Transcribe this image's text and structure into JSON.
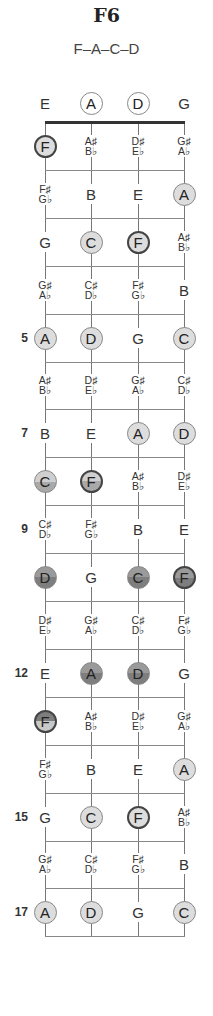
{
  "title": "F6",
  "subtitle": "F–A–C–D",
  "colors": {
    "line": "#777777",
    "nut": "#333333",
    "light_fill": "#dddddd",
    "mid_fill": "#a9a9a9",
    "dark_fill": "#7e7e7e",
    "root_border": "#444444"
  },
  "strings": [
    "E",
    "A",
    "D",
    "G"
  ],
  "fret_labels": [
    {
      "fret": 5,
      "label": "5"
    },
    {
      "fret": 7,
      "label": "7"
    },
    {
      "fret": 9,
      "label": "9"
    },
    {
      "fret": 12,
      "label": "12"
    },
    {
      "fret": 15,
      "label": "15"
    },
    {
      "fret": 17,
      "label": "17"
    }
  ],
  "rows": [
    {
      "fret": 0,
      "notes": [
        {
          "text": "E",
          "style": "plain"
        },
        {
          "text": "A",
          "style": "open"
        },
        {
          "text": "D",
          "style": "open"
        },
        {
          "text": "G",
          "style": "plain"
        }
      ]
    },
    {
      "fret": 1,
      "notes": [
        {
          "text": "F",
          "style": "root"
        },
        {
          "sharp": "A♯",
          "flat": "B♭",
          "style": "pair"
        },
        {
          "sharp": "D♯",
          "flat": "E♭",
          "style": "pair"
        },
        {
          "sharp": "G♯",
          "flat": "A♭",
          "style": "pair"
        }
      ]
    },
    {
      "fret": 2,
      "notes": [
        {
          "sharp": "F♯",
          "flat": "G♭",
          "style": "pair"
        },
        {
          "text": "B",
          "style": "plain"
        },
        {
          "text": "E",
          "style": "plain"
        },
        {
          "text": "A",
          "style": "light"
        }
      ]
    },
    {
      "fret": 3,
      "notes": [
        {
          "text": "G",
          "style": "plain"
        },
        {
          "text": "C",
          "style": "light"
        },
        {
          "text": "F",
          "style": "root"
        },
        {
          "sharp": "A♯",
          "flat": "B♭",
          "style": "pair"
        }
      ]
    },
    {
      "fret": 4,
      "notes": [
        {
          "sharp": "G♯",
          "flat": "A♭",
          "style": "pair"
        },
        {
          "sharp": "C♯",
          "flat": "D♭",
          "style": "pair"
        },
        {
          "sharp": "F♯",
          "flat": "G♭",
          "style": "pair"
        },
        {
          "text": "B",
          "style": "plain"
        }
      ]
    },
    {
      "fret": 5,
      "notes": [
        {
          "text": "A",
          "style": "light"
        },
        {
          "text": "D",
          "style": "light"
        },
        {
          "text": "G",
          "style": "plain"
        },
        {
          "text": "C",
          "style": "light"
        }
      ]
    },
    {
      "fret": 6,
      "notes": [
        {
          "sharp": "A♯",
          "flat": "B♭",
          "style": "pair"
        },
        {
          "sharp": "D♯",
          "flat": "E♭",
          "style": "pair"
        },
        {
          "sharp": "G♯",
          "flat": "A♭",
          "style": "pair"
        },
        {
          "sharp": "C♯",
          "flat": "D♭",
          "style": "pair"
        }
      ]
    },
    {
      "fret": 7,
      "notes": [
        {
          "text": "B",
          "style": "plain"
        },
        {
          "text": "E",
          "style": "plain"
        },
        {
          "text": "A",
          "style": "light"
        },
        {
          "text": "D",
          "style": "light"
        }
      ]
    },
    {
      "fret": 8,
      "notes": [
        {
          "text": "C",
          "style": "half"
        },
        {
          "text": "F",
          "style": "half-root"
        },
        {
          "sharp": "A♯",
          "flat": "B♭",
          "style": "pair"
        },
        {
          "sharp": "D♯",
          "flat": "E♭",
          "style": "pair"
        }
      ]
    },
    {
      "fret": 9,
      "notes": [
        {
          "sharp": "C♯",
          "flat": "D♭",
          "style": "pair"
        },
        {
          "sharp": "F♯",
          "flat": "G♭",
          "style": "pair"
        },
        {
          "text": "B",
          "style": "plain"
        },
        {
          "text": "E",
          "style": "plain"
        }
      ]
    },
    {
      "fret": 10,
      "notes": [
        {
          "text": "D",
          "style": "dark"
        },
        {
          "text": "G",
          "style": "plain"
        },
        {
          "text": "C",
          "style": "dark"
        },
        {
          "text": "F",
          "style": "dark-root"
        }
      ]
    },
    {
      "fret": 11,
      "notes": [
        {
          "sharp": "D♯",
          "flat": "E♭",
          "style": "pair"
        },
        {
          "sharp": "G♯",
          "flat": "A♭",
          "style": "pair"
        },
        {
          "sharp": "C♯",
          "flat": "D♭",
          "style": "pair"
        },
        {
          "sharp": "F♯",
          "flat": "G♭",
          "style": "pair"
        }
      ]
    },
    {
      "fret": 12,
      "notes": [
        {
          "text": "E",
          "style": "plain"
        },
        {
          "text": "A",
          "style": "dark"
        },
        {
          "text": "D",
          "style": "dark"
        },
        {
          "text": "G",
          "style": "plain"
        }
      ]
    },
    {
      "fret": 13,
      "notes": [
        {
          "text": "F",
          "style": "halfdark-root"
        },
        {
          "sharp": "A♯",
          "flat": "B♭",
          "style": "pair"
        },
        {
          "sharp": "D♯",
          "flat": "E♭",
          "style": "pair"
        },
        {
          "sharp": "G♯",
          "flat": "A♭",
          "style": "pair"
        }
      ]
    },
    {
      "fret": 14,
      "notes": [
        {
          "sharp": "F♯",
          "flat": "G♭",
          "style": "pair"
        },
        {
          "text": "B",
          "style": "plain"
        },
        {
          "text": "E",
          "style": "plain"
        },
        {
          "text": "A",
          "style": "light"
        }
      ]
    },
    {
      "fret": 15,
      "notes": [
        {
          "text": "G",
          "style": "plain"
        },
        {
          "text": "C",
          "style": "light"
        },
        {
          "text": "F",
          "style": "root"
        },
        {
          "sharp": "A♯",
          "flat": "B♭",
          "style": "pair"
        }
      ]
    },
    {
      "fret": 16,
      "notes": [
        {
          "sharp": "G♯",
          "flat": "A♭",
          "style": "pair"
        },
        {
          "sharp": "C♯",
          "flat": "D♭",
          "style": "pair"
        },
        {
          "sharp": "F♯",
          "flat": "G♭",
          "style": "pair"
        },
        {
          "text": "B",
          "style": "plain"
        }
      ]
    },
    {
      "fret": 17,
      "notes": [
        {
          "text": "A",
          "style": "light"
        },
        {
          "text": "D",
          "style": "light"
        },
        {
          "text": "G",
          "style": "plain"
        },
        {
          "text": "C",
          "style": "light"
        }
      ]
    }
  ]
}
